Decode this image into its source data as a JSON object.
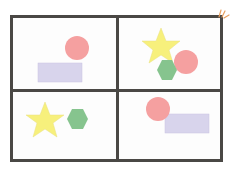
{
  "diagram": {
    "layout": "2x2 grid",
    "frame_color": "#4a4845",
    "colors": {
      "circle": "#f5a0a0",
      "rectangle": "#d8d4ec",
      "star": "#f7f07c",
      "hexagon": "#86c48e",
      "burst": "#e8a060"
    },
    "panels": [
      {
        "position": "top-left",
        "shapes": [
          "circle",
          "rectangle"
        ]
      },
      {
        "position": "top-right",
        "shapes": [
          "star",
          "hexagon",
          "circle"
        ]
      },
      {
        "position": "bottom-left",
        "shapes": [
          "star",
          "hexagon"
        ]
      },
      {
        "position": "bottom-right",
        "shapes": [
          "circle",
          "rectangle"
        ]
      }
    ]
  }
}
